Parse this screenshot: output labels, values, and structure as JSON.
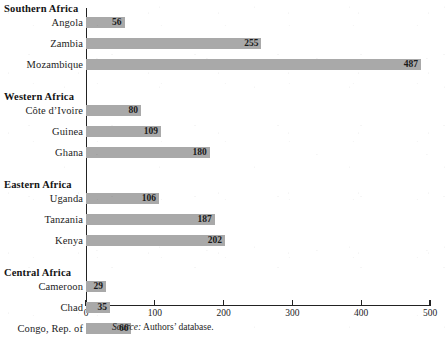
{
  "chart_data": {
    "type": "bar",
    "orientation": "horizontal",
    "title": "",
    "xlabel": "",
    "ylabel": "",
    "xlim": [
      0,
      500
    ],
    "xticks": [
      0,
      100,
      200,
      300,
      400,
      500
    ],
    "xtick_labels": [
      "0",
      "100",
      "200",
      "300",
      "400",
      "500"
    ],
    "grid": false,
    "legend": false,
    "bar_color": "#a9a9a9",
    "axis_color": "#222222",
    "groups": [
      {
        "name": "Southern Africa",
        "items": [
          {
            "label": "Angola",
            "value": 56
          },
          {
            "label": "Zambia",
            "value": 255
          },
          {
            "label": "Mozambique",
            "value": 487
          }
        ]
      },
      {
        "name": "Western Africa",
        "items": [
          {
            "label": "Côte d’Ivoire",
            "value": 80
          },
          {
            "label": "Guinea",
            "value": 109
          },
          {
            "label": "Ghana",
            "value": 180
          }
        ]
      },
      {
        "name": "Eastern Africa",
        "items": [
          {
            "label": "Uganda",
            "value": 106
          },
          {
            "label": "Tanzania",
            "value": 187
          },
          {
            "label": "Kenya",
            "value": 202
          }
        ]
      },
      {
        "name": "Central Africa",
        "items": [
          {
            "label": "Cameroon",
            "value": 29
          },
          {
            "label": "Chad",
            "value": 35
          },
          {
            "label": "Congo, Rep. of",
            "value": 66
          }
        ]
      }
    ],
    "categories": [
      "Angola",
      "Zambia",
      "Mozambique",
      "Côte d’Ivoire",
      "Guinea",
      "Ghana",
      "Uganda",
      "Tanzania",
      "Kenya",
      "Cameroon",
      "Chad",
      "Congo, Rep. of"
    ],
    "values": [
      56,
      255,
      487,
      80,
      109,
      180,
      106,
      187,
      202,
      29,
      35,
      66
    ]
  },
  "source": {
    "prefix": "Source:",
    "text": "Authors’ database."
  }
}
